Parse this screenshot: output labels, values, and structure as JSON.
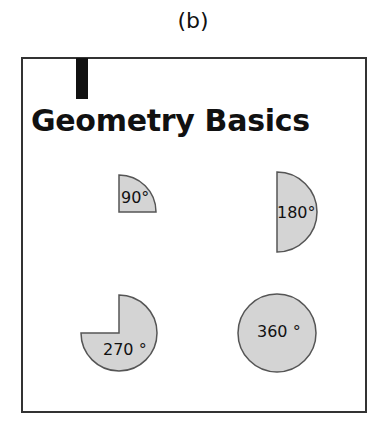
{
  "caption": "(b)",
  "title": "Geometry Basics",
  "shapes": [
    {
      "id": "quarter",
      "label": "90°"
    },
    {
      "id": "half",
      "label": "180°"
    },
    {
      "id": "three-quarter",
      "label": "270 °"
    },
    {
      "id": "full",
      "label": "360 °"
    }
  ],
  "colors": {
    "fill": "#d4d4d4",
    "stroke": "#555555"
  }
}
